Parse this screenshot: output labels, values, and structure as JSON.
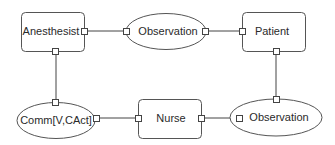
{
  "diagram": {
    "nodes": [
      {
        "id": "anesthesist",
        "label": "Anesthesist",
        "shape": "rounded-rect"
      },
      {
        "id": "observation_top",
        "label": "Observation",
        "shape": "ellipse"
      },
      {
        "id": "patient",
        "label": "Patient",
        "shape": "rounded-rect"
      },
      {
        "id": "comm",
        "label": "Comm[V,CAct]",
        "shape": "ellipse"
      },
      {
        "id": "nurse",
        "label": "Nurse",
        "shape": "rounded-rect"
      },
      {
        "id": "observation_bottom",
        "label": "Observation",
        "shape": "ellipse"
      }
    ],
    "edges": [
      {
        "from": "anesthesist",
        "to": "observation_top"
      },
      {
        "from": "observation_top",
        "to": "patient"
      },
      {
        "from": "patient",
        "to": "observation_bottom"
      },
      {
        "from": "observation_bottom",
        "to": "nurse"
      },
      {
        "from": "nurse",
        "to": "comm"
      },
      {
        "from": "comm",
        "to": "anesthesist"
      }
    ],
    "colors": {
      "stroke": "#555555",
      "fill": "#ffffff",
      "text": "#2a2a2a"
    }
  }
}
